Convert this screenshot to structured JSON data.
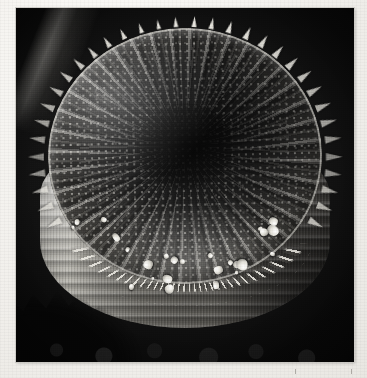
{
  "page": {
    "background_color": "#f1efeb",
    "medium": "scanned print on white paper"
  },
  "plate": {
    "name": "sem-micrograph",
    "caption": "",
    "subject": "centric diatom frustule",
    "technique": "scanning electron micrograph",
    "background_color": "#070707",
    "orientation": "oblique view of drum-shaped frustule",
    "bounds": {
      "left": 16,
      "top": 8,
      "width": 338,
      "height": 354
    }
  },
  "specimen": {
    "label": "diatom-frustule",
    "parts": [
      {
        "name": "valve-face",
        "description": "circular top disc with radial costae and punctate areolae"
      },
      {
        "name": "central-annulus",
        "description": "dark hyaline centre with spiralling areola rows"
      },
      {
        "name": "marginal-spines",
        "description": "ring of sharp fultoportula spines on the valve rim",
        "count": 34
      },
      {
        "name": "girdle-bands",
        "description": "stacked concentric copulae forming the cylindrical mantle",
        "count": 11
      },
      {
        "name": "bead-ring",
        "description": "necklace of bright beads where valve meets mantle"
      },
      {
        "name": "mineral-granules",
        "description": "bright debris particles on the lower valve face",
        "count": 26
      },
      {
        "name": "debris-field",
        "description": "dark jagged substrate debris at lower left"
      }
    ]
  },
  "tonality": {
    "highlight": "#ffffff",
    "midtone": "#8a8880",
    "shadow": "#0c0c0c",
    "background": "#070707"
  },
  "margin_marks": {
    "left_tick": "|",
    "right_tick": "|"
  }
}
